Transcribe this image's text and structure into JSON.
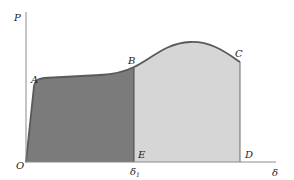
{
  "diagram": {
    "type": "load-deformation curve with shaded work areas",
    "axes": {
      "y_label": "P",
      "x_label": "δ",
      "origin_label": "O"
    },
    "points": [
      {
        "label": "O",
        "x": 26,
        "y": 162
      },
      {
        "label": "A",
        "x": 38,
        "y": 80
      },
      {
        "label": "B",
        "x": 134,
        "y": 67
      },
      {
        "label": "C",
        "x": 240,
        "y": 62
      },
      {
        "label": "D",
        "x": 240,
        "y": 162
      },
      {
        "label": "E",
        "x": 134,
        "y": 162
      }
    ],
    "labels": {
      "A": "A",
      "B": "B",
      "C": "C",
      "D": "D",
      "E": "E",
      "O": "O",
      "delta1": "δ",
      "delta1_sub": "1"
    },
    "regions": [
      {
        "name": "region-OABE",
        "fill": "#7b7b7b"
      },
      {
        "name": "region-EBCD",
        "fill": "#d6d6d6"
      }
    ],
    "colors": {
      "axis": "#8a8a8a",
      "curve": "#5a5a5a",
      "dark_fill": "#7b7b7b",
      "light_fill": "#d6d6d6",
      "text": "#222222"
    }
  }
}
